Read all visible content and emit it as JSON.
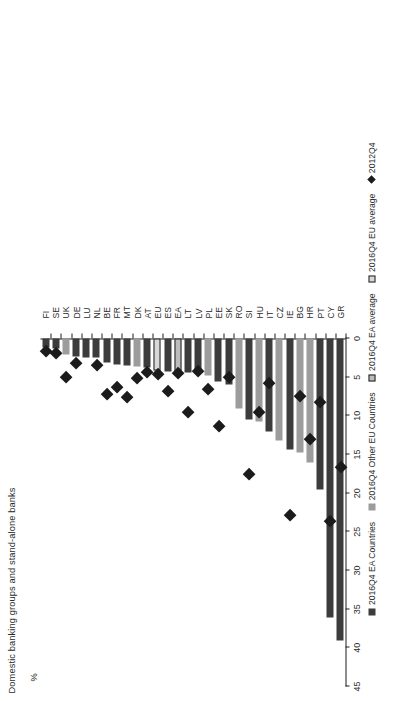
{
  "chart_data": {
    "type": "bar",
    "title": "Domestic banking groups and stand-alone banks",
    "xlabel": "",
    "ylabel": "%",
    "ylim": [
      0,
      45
    ],
    "ytick_labels": [
      "0",
      "5",
      "10",
      "15",
      "20",
      "25",
      "30",
      "35",
      "40",
      "45"
    ],
    "ytick_values": [
      0,
      5,
      10,
      15,
      20,
      25,
      30,
      35,
      40,
      45
    ],
    "grid": false,
    "orientation": "vertical-rotated",
    "legend_position": "bottom",
    "categories": [
      "GR",
      "CY",
      "PT",
      "HR",
      "BG",
      "IE",
      "CZ",
      "IT",
      "HU",
      "SI",
      "RO",
      "SK",
      "EE",
      "PL",
      "LV",
      "LT",
      "EA",
      "ES",
      "EU",
      "AT",
      "DK",
      "MT",
      "FR",
      "BE",
      "NL",
      "LU",
      "DE",
      "UK",
      "SE",
      "FI"
    ],
    "series": [
      {
        "name": "2016Q4 EA Countries",
        "color": "#3c3c3c",
        "values": [
          39.0,
          36.1,
          19.5,
          null,
          null,
          14.3,
          null,
          12.0,
          null,
          10.5,
          null,
          6.0,
          5.5,
          null,
          4.5,
          4.4,
          null,
          4.3,
          null,
          3.8,
          null,
          3.5,
          3.3,
          3.1,
          2.5,
          2.4,
          2.3,
          null,
          1.3,
          1.2
        ]
      },
      {
        "name": "2016Q4 Other EU Countries",
        "color": "#9c9c9c",
        "values": [
          null,
          null,
          null,
          16.0,
          14.8,
          null,
          13.2,
          null,
          10.7,
          null,
          9.1,
          null,
          null,
          4.8,
          null,
          null,
          null,
          null,
          null,
          null,
          3.6,
          null,
          null,
          null,
          null,
          null,
          null,
          2.1,
          null,
          null
        ]
      },
      {
        "name": "2016Q4 EA average",
        "color": "#bdbdbd",
        "values": [
          null,
          null,
          null,
          null,
          null,
          null,
          null,
          null,
          null,
          null,
          null,
          null,
          null,
          null,
          null,
          null,
          4.4,
          null,
          null,
          null,
          null,
          null,
          null,
          null,
          null,
          null,
          null,
          null,
          null,
          null
        ]
      },
      {
        "name": "2016Q4 EU average",
        "color": "#d8d8d8",
        "values": [
          null,
          null,
          null,
          null,
          null,
          null,
          null,
          null,
          null,
          null,
          null,
          null,
          null,
          null,
          null,
          null,
          null,
          null,
          4.1,
          null,
          null,
          null,
          null,
          null,
          null,
          null,
          null,
          null,
          null,
          null
        ]
      },
      {
        "name": "2012Q4",
        "color": "#1b1b1b",
        "marker": "diamond",
        "values": [
          16.7,
          23.6,
          8.3,
          13.0,
          7.5,
          22.8,
          null,
          5.8,
          9.5,
          17.5,
          null,
          5.0,
          11.4,
          6.6,
          4.2,
          9.5,
          4.5,
          6.8,
          4.6,
          4.4,
          5.1,
          7.6,
          6.3,
          7.2,
          3.5,
          null,
          3.2,
          5.0,
          1.9,
          1.6
        ]
      }
    ],
    "legend": [
      {
        "label": "2016Q4 EA Countries",
        "swatch": "ea"
      },
      {
        "label": "2016Q4 Other EU Countries",
        "swatch": "other"
      },
      {
        "label": "2016Q4 EA average",
        "swatch": "avgea"
      },
      {
        "label": "2016Q4 EU average",
        "swatch": "avgeu"
      },
      {
        "label": "2012Q4",
        "swatch": "dot"
      }
    ]
  }
}
